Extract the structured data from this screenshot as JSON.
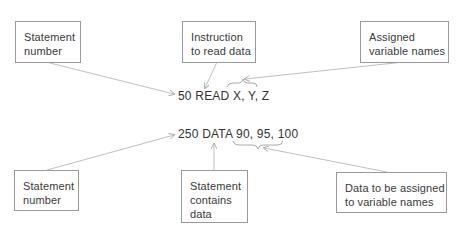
{
  "diagram": {
    "statements": {
      "read": "50 READ X, Y, Z",
      "data": "250 DATA 90, 95, 100"
    },
    "top_labels": {
      "statement_number": [
        "Statement",
        "number"
      ],
      "instruction": [
        "Instruction",
        "to read data"
      ],
      "assigned_vars": [
        "Assigned",
        "variable names"
      ]
    },
    "bottom_labels": {
      "statement_number": [
        "Statement",
        "number"
      ],
      "contains_data": [
        "Statement",
        "contains",
        "data"
      ],
      "data_assigned": [
        "Data to be assigned",
        "to variable names"
      ]
    },
    "colors": {
      "line": "#b0b0b0",
      "box_border": "#9a9a9a",
      "text": "#3a3a3a"
    }
  }
}
